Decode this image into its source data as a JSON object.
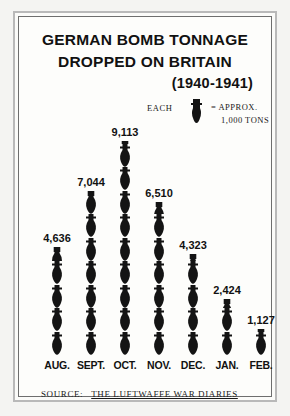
{
  "poster": {
    "title_line_1": "GERMAN BOMB TONNAGE",
    "title_line_2": "DROPPED ON BRITAIN",
    "title_years": "(1940-1941)",
    "source_label": "SOURCE:",
    "source_title": "THE LUFTWAFFE WAR DIARIES",
    "frame_color": "#6e6e6e",
    "background_color": "#f4f4f2",
    "ink_color": "#111111"
  },
  "legend": {
    "each_label": "EACH",
    "icon": "bomb-icon",
    "equals_label": "= APPROX.",
    "unit_label": "1,000 TONS"
  },
  "chart_data": {
    "type": "bar",
    "title": "GERMAN BOMB TONNAGE DROPPED ON BRITAIN (1940-1941)",
    "subtitle": "EACH BOMB = APPROX. 1,000 TONS",
    "xlabel": "",
    "ylabel": "",
    "unit": "tons",
    "units_per_icon": 1000,
    "grid": false,
    "legend_position": "top-right",
    "ylim": [
      0,
      9113
    ],
    "categories": [
      "AUG.",
      "SEPT.",
      "OCT.",
      "NOV.",
      "DEC.",
      "JAN.",
      "FEB."
    ],
    "values": [
      4636,
      7044,
      9113,
      6510,
      4323,
      2424,
      1127
    ],
    "value_labels": [
      "4,636",
      "7,044",
      "9,113",
      "6,510",
      "4,323",
      "2,424",
      "1,127"
    ],
    "icons_per_bar": [
      4.6,
      7.0,
      9.1,
      6.5,
      4.3,
      2.4,
      1.1
    ],
    "source": "THE LUFTWAFFE WAR DIARIES"
  }
}
